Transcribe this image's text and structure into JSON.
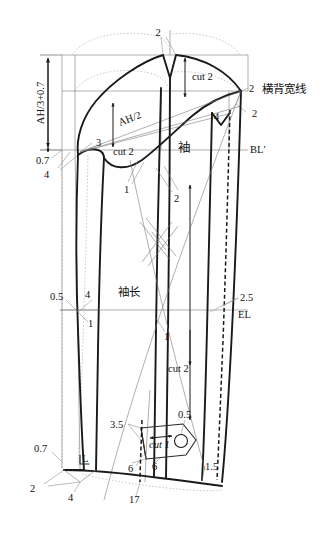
{
  "drawing": {
    "title": "袖子结构制图",
    "type": "sleeve-pattern-draft",
    "canvas": {
      "width": 325,
      "height": 534
    },
    "colors": {
      "outline": "#1a1a1a",
      "construction": "#7b7b7b",
      "guide": "#a6a6a6",
      "background": "#ffffff"
    }
  },
  "labels": {
    "sleeve_cap_top": "2",
    "cut_2_cap": "cut 2",
    "back_width_line_num": "2",
    "back_width_line_text": "横背宽线",
    "back_width_right_num": "2",
    "cap_right_4": "4",
    "ah_third": "AH/3+0.7",
    "ah_half": "AH/2",
    "three": "3",
    "cut_2_under": "cut 2",
    "sleeve_cn": "袖",
    "bl_line": "BL′",
    "zero_seven_top": "0.7",
    "four_top": "4",
    "notch_one": "1",
    "notch_two": "2",
    "zero_five_mid": "0.5",
    "four_mid": "4",
    "one_mid": "1",
    "sleeve_length_cn": "袖长",
    "one_lower": "1",
    "two_five": "2.5",
    "el_line": "EL",
    "cut_2_lower": "cut 2",
    "three_five": "3.5",
    "zero_five_tab": "0.5",
    "cut_1_tab": "cut 1",
    "six_left": "6",
    "six_right": "6",
    "one_five": "1.5",
    "zero_seven_bot": "0.7",
    "corner_L": "L",
    "two_bot": "2",
    "four_bot": "4",
    "seventeen": "17"
  },
  "measurements": [
    {
      "name": "sleeve-cap-height",
      "text": "AH/3+0.7",
      "kind": "formula"
    },
    {
      "name": "sleeve-cap-width",
      "text": "AH/2",
      "kind": "formula"
    },
    {
      "name": "sleeve-length",
      "text": "袖长",
      "kind": "chinese"
    },
    {
      "name": "back-width-line",
      "text": "横背宽线",
      "kind": "chinese"
    },
    {
      "name": "bust-line",
      "text": "BL′",
      "kind": "code"
    },
    {
      "name": "elbow-line",
      "text": "EL",
      "kind": "code"
    },
    {
      "name": "hem-width",
      "text": "17",
      "kind": "number"
    }
  ],
  "piece_counts": [
    {
      "name": "sleeve-cap-cut",
      "text": "cut 2"
    },
    {
      "name": "undersleeve-cut",
      "text": "cut 2"
    },
    {
      "name": "sleeve-lower-cut",
      "text": "cut 2"
    },
    {
      "name": "cuff-tab-cut",
      "text": "cut 1"
    }
  ],
  "numeric_callouts": [
    "2",
    "2",
    "2",
    "4",
    "3",
    "0.7",
    "4",
    "1",
    "2",
    "0.5",
    "4",
    "1",
    "1",
    "2.5",
    "3.5",
    "0.5",
    "6",
    "6",
    "1.5",
    "0.7",
    "2",
    "4",
    "17"
  ]
}
